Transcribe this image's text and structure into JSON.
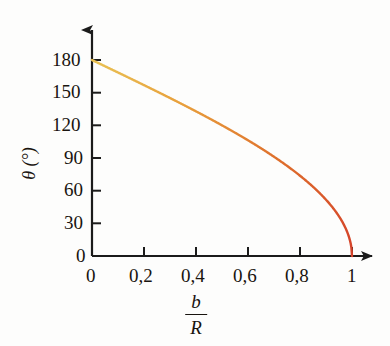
{
  "figure": {
    "background_color": "#fdfdfc",
    "axis_color": "#1b1b1b",
    "curve_color_start": "#e8c04a",
    "curve_color_end": "#d8462a"
  },
  "axes": {
    "y_title": "θ (°)",
    "x_title_numerator": "b",
    "x_title_denominator": "R",
    "y_ticks": [
      "0",
      "30",
      "60",
      "90",
      "120",
      "150",
      "180"
    ],
    "x_ticks": [
      "0",
      "0,2",
      "0,4",
      "0,6",
      "0,8",
      "1"
    ]
  },
  "chart_data": {
    "type": "line",
    "title": "",
    "subtitle": "",
    "xlabel": "b/R",
    "ylabel": "θ (°)",
    "xlim": [
      0,
      1
    ],
    "ylim": [
      0,
      180
    ],
    "xticks": [
      0,
      0.2,
      0.4,
      0.6,
      0.8,
      1
    ],
    "xticklabels": [
      "0",
      "0,2",
      "0,4",
      "0,6",
      "0,8",
      "1"
    ],
    "yticks": [
      0,
      30,
      60,
      90,
      120,
      150,
      180
    ],
    "yticklabels": [
      "0",
      "30",
      "60",
      "90",
      "120",
      "150",
      "180"
    ],
    "grid": false,
    "legend": null,
    "legend_position": "none",
    "annotations": [],
    "series": [
      {
        "name": "theta = 2 arccos(b/R)",
        "color": "#dd5a2a",
        "linewidth": 2.4,
        "x": [
          0.0,
          0.05,
          0.1,
          0.15,
          0.2,
          0.25,
          0.3,
          0.35,
          0.4,
          0.45,
          0.5,
          0.55,
          0.6,
          0.65,
          0.7,
          0.75,
          0.8,
          0.85,
          0.9,
          0.93,
          0.95,
          0.97,
          0.98,
          0.99,
          0.995,
          1.0
        ],
        "y": [
          180.0,
          174.3,
          168.5,
          162.8,
          157.1,
          151.3,
          145.4,
          145.4,
          133.4,
          127.2,
          120.0,
          113.3,
          106.3,
          99.0,
          91.1,
          82.8,
          73.7,
          63.6,
          51.7,
          43.2,
          36.3,
          28.1,
          22.9,
          16.2,
          11.5,
          0.0
        ]
      }
    ]
  },
  "curve_points": {
    "note": "theta = 2*arccos(b/R), degrees"
  }
}
